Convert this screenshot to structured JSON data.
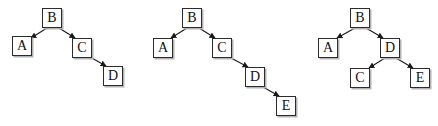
{
  "figure": {
    "background_color": "#ffffff",
    "node_border_color": "#2b2b2b",
    "node_fill_color": "#ffffff",
    "node_shadow_color": "#b4b4b4",
    "edge_color": "#1a1a1a",
    "label_color": "#111111"
  },
  "diagrams": [
    {
      "name": "tree-1",
      "nodes": [
        {
          "id": "d1-B",
          "label": "B",
          "x": 42,
          "y": 8
        },
        {
          "id": "d1-A",
          "label": "A",
          "x": 12,
          "y": 36
        },
        {
          "id": "d1-C",
          "label": "C",
          "x": 72,
          "y": 38
        },
        {
          "id": "d1-D",
          "label": "D",
          "x": 103,
          "y": 66
        }
      ],
      "edges": [
        {
          "from": "B",
          "to": "A",
          "x1": 47,
          "y1": 28,
          "x2": 31,
          "y2": 38
        },
        {
          "from": "B",
          "to": "C",
          "x1": 59,
          "y1": 28,
          "x2": 75,
          "y2": 38
        },
        {
          "from": "C",
          "to": "D",
          "x1": 90,
          "y1": 57,
          "x2": 106,
          "y2": 66
        }
      ]
    },
    {
      "name": "tree-2",
      "nodes": [
        {
          "id": "d2-B",
          "label": "B",
          "x": 182,
          "y": 8
        },
        {
          "id": "d2-A",
          "label": "A",
          "x": 153,
          "y": 38
        },
        {
          "id": "d2-C",
          "label": "C",
          "x": 212,
          "y": 38
        },
        {
          "id": "d2-D",
          "label": "D",
          "x": 245,
          "y": 67
        },
        {
          "id": "d2-E",
          "label": "E",
          "x": 276,
          "y": 96
        }
      ],
      "edges": [
        {
          "from": "B",
          "to": "A",
          "x1": 187,
          "y1": 28,
          "x2": 171,
          "y2": 38
        },
        {
          "from": "B",
          "to": "C",
          "x1": 199,
          "y1": 28,
          "x2": 215,
          "y2": 38
        },
        {
          "from": "C",
          "to": "D",
          "x1": 231,
          "y1": 58,
          "x2": 248,
          "y2": 67
        },
        {
          "from": "D",
          "to": "E",
          "x1": 263,
          "y1": 87,
          "x2": 279,
          "y2": 96
        }
      ]
    },
    {
      "name": "tree-3",
      "nodes": [
        {
          "id": "d3-B",
          "label": "B",
          "x": 350,
          "y": 8
        },
        {
          "id": "d3-A",
          "label": "A",
          "x": 318,
          "y": 38
        },
        {
          "id": "d3-D",
          "label": "D",
          "x": 380,
          "y": 38
        },
        {
          "id": "d3-C",
          "label": "C",
          "x": 350,
          "y": 68
        },
        {
          "id": "d3-E",
          "label": "E",
          "x": 410,
          "y": 68
        }
      ],
      "edges": [
        {
          "from": "B",
          "to": "A",
          "x1": 355,
          "y1": 28,
          "x2": 337,
          "y2": 38
        },
        {
          "from": "B",
          "to": "D",
          "x1": 366,
          "y1": 28,
          "x2": 383,
          "y2": 38
        },
        {
          "from": "D",
          "to": "C",
          "x1": 385,
          "y1": 58,
          "x2": 369,
          "y2": 68
        },
        {
          "from": "D",
          "to": "E",
          "x1": 396,
          "y1": 58,
          "x2": 413,
          "y2": 68
        }
      ]
    }
  ]
}
